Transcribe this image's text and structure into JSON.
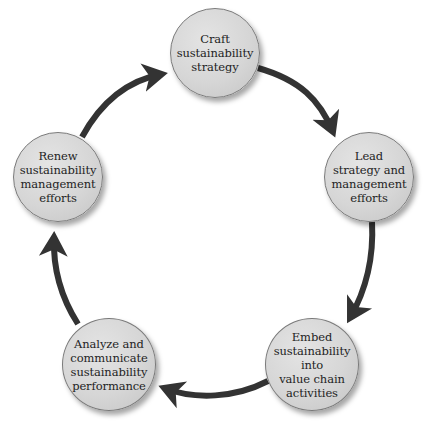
{
  "diagram": {
    "type": "cycle",
    "colors": {
      "node_fill": "#d6d6d6",
      "node_border": "#7a7a7a",
      "arrow": "#333333",
      "text": "#1e1e1e"
    },
    "nodes": [
      {
        "id": "craft",
        "label": "Craft\nsustainability\nstrategy"
      },
      {
        "id": "lead",
        "label": "Lead\nstrategy and\nmanagement\nefforts"
      },
      {
        "id": "embed",
        "label": "Embed\nsustainability\ninto\nvalue chain\nactivities"
      },
      {
        "id": "analyze",
        "label": "Analyze and\ncommunicate\nsustainability\nperformance"
      },
      {
        "id": "renew",
        "label": "Renew\nsustainability\nmanagement\nefforts"
      }
    ],
    "edges": [
      {
        "from": "craft",
        "to": "lead"
      },
      {
        "from": "lead",
        "to": "embed"
      },
      {
        "from": "embed",
        "to": "analyze"
      },
      {
        "from": "analyze",
        "to": "renew"
      },
      {
        "from": "renew",
        "to": "craft"
      }
    ]
  }
}
